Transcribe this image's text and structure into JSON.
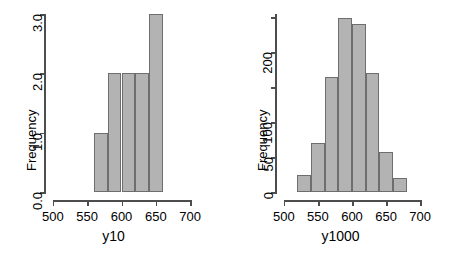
{
  "figure": {
    "background": "#ffffff",
    "bar_fill": "#b3b3b3",
    "bar_border": "#6e6e6e",
    "axis_color": "#4d4d4d"
  },
  "chart_data": [
    {
      "type": "bar",
      "subtype": "histogram",
      "panel": "left",
      "title": "",
      "xlabel": "y10",
      "ylabel": "Frequency",
      "xlim": [
        490,
        710
      ],
      "ylim": [
        0,
        3.0
      ],
      "grid": false,
      "legend": null,
      "x_ticks": [
        500,
        550,
        600,
        650,
        700
      ],
      "x_tick_labels": [
        "500",
        "550",
        "600",
        "650",
        "700"
      ],
      "y_ticks": [
        0.0,
        1.0,
        2.0,
        3.0
      ],
      "y_tick_labels": [
        "0.0",
        "1.0",
        "2.0",
        "3.0"
      ],
      "bin_width": 20,
      "bins": [
        {
          "left": 560,
          "right": 580,
          "value": 1
        },
        {
          "left": 580,
          "right": 600,
          "value": 2
        },
        {
          "left": 600,
          "right": 620,
          "value": 2
        },
        {
          "left": 620,
          "right": 640,
          "value": 2
        },
        {
          "left": 640,
          "right": 660,
          "value": 3
        }
      ],
      "categories": [
        "560-580",
        "580-600",
        "600-620",
        "620-640",
        "640-660"
      ],
      "values": [
        1,
        2,
        2,
        2,
        3
      ]
    },
    {
      "type": "bar",
      "subtype": "histogram",
      "panel": "right",
      "title": "",
      "xlabel": "y1000",
      "ylabel": "Frequency",
      "xlim": [
        490,
        710
      ],
      "ylim": [
        0,
        255
      ],
      "grid": false,
      "legend": null,
      "x_ticks": [
        500,
        550,
        600,
        650,
        700
      ],
      "x_tick_labels": [
        "500",
        "550",
        "600",
        "650",
        "700"
      ],
      "y_ticks": [
        0,
        50,
        100,
        150,
        200,
        250
      ],
      "y_tick_labels": [
        "0",
        "50",
        "100",
        "",
        "200",
        ""
      ],
      "bin_width": 20,
      "bins": [
        {
          "left": 520,
          "right": 540,
          "value": 25
        },
        {
          "left": 540,
          "right": 560,
          "value": 70
        },
        {
          "left": 560,
          "right": 580,
          "value": 165
        },
        {
          "left": 580,
          "right": 600,
          "value": 250
        },
        {
          "left": 600,
          "right": 620,
          "value": 240
        },
        {
          "left": 620,
          "right": 640,
          "value": 170
        },
        {
          "left": 640,
          "right": 660,
          "value": 57
        },
        {
          "left": 660,
          "right": 680,
          "value": 20
        }
      ],
      "categories": [
        "520-540",
        "540-560",
        "560-580",
        "580-600",
        "600-620",
        "620-640",
        "640-660",
        "660-680"
      ],
      "values": [
        25,
        70,
        165,
        250,
        240,
        170,
        57,
        20
      ]
    }
  ]
}
